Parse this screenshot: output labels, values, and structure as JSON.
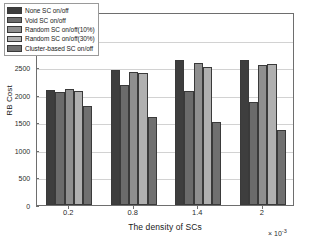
{
  "chart_data": {
    "type": "bar",
    "title": "",
    "xlabel": "The density of SCs",
    "ylabel": "RB Cost",
    "x_multiplier": "× 10",
    "x_multiplier_exp": "-3",
    "categories": [
      "0.2",
      "0.8",
      "1.4",
      "2"
    ],
    "ylim": [
      0,
      3500
    ],
    "yticks": [
      0,
      500,
      1000,
      1500,
      2000,
      2500,
      3000,
      3500
    ],
    "ytick_labels": [
      "0",
      "500",
      "1000",
      "1500",
      "2000",
      "2500",
      "3000",
      "3500"
    ],
    "grid": true,
    "legend_position": "upper-left",
    "series": [
      {
        "name": "None SC on/off",
        "color": "#3e3e3e",
        "values": [
          2085,
          2455,
          2625,
          2630
        ]
      },
      {
        "name": "Void SC on/off",
        "color": "#6b6b6b",
        "values": [
          2050,
          2180,
          2075,
          1865
        ]
      },
      {
        "name": "Random SC on/off(10%)",
        "color": "#8f8f8f",
        "values": [
          2105,
          2410,
          2570,
          2535
        ]
      },
      {
        "name": "Random SC on/off(30%)",
        "color": "#b0b0b0",
        "values": [
          2060,
          2390,
          2495,
          2555
        ]
      },
      {
        "name": "Cluster-based SC on/off",
        "color": "#707070",
        "values": [
          1800,
          1600,
          1505,
          1360
        ]
      }
    ]
  }
}
